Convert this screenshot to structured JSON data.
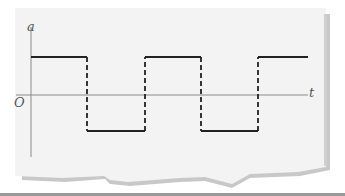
{
  "figure": {
    "y_axis_label": "a",
    "x_axis_label": "t",
    "origin_label": "O"
  },
  "colors": {
    "paper": "#f3f3f3",
    "paper_shadow": "#c8c8c8",
    "axis": "#8a8a8a",
    "waveform": "#222222",
    "label": "#555555",
    "bottom_rule": "#9a9a9a"
  },
  "waveform": {
    "type": "square-wave",
    "high_level_y": 57,
    "low_level_y": 131,
    "axis_y": 95,
    "start_x": 31,
    "transitions_x": [
      87,
      145,
      201,
      258
    ],
    "end_x": 308,
    "initial_state": "high",
    "transition_style": "dashed"
  }
}
